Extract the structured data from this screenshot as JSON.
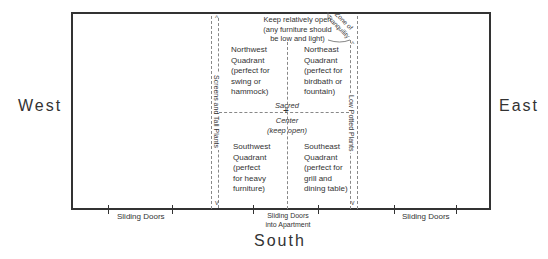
{
  "compass": {
    "west": "West",
    "east": "East",
    "south": "South"
  },
  "top_note": {
    "line1": "Keep relatively open",
    "line2": "(any furniture should",
    "line3": "be low and light)"
  },
  "zone": {
    "line1": "Zone of",
    "line2": "Tranquility"
  },
  "quadrants": {
    "northwest": [
      "Northwest",
      "Quadrant",
      "(perfect for",
      "swing or",
      "hammock)"
    ],
    "northeast": [
      "Northeast",
      "Quadrant",
      "(perfect for",
      "birdbath or",
      "fountain)"
    ],
    "southwest": [
      "Southwest",
      "Quadrant",
      "(perfect",
      "for heavy",
      "furniture)"
    ],
    "southeast": [
      "Southeast",
      "Quadrant",
      "(perfect for",
      "grill and",
      "dining table)"
    ]
  },
  "center": {
    "top": "Sacred",
    "bottom1": "Center",
    "bottom2": "(keep open)"
  },
  "side_bands": {
    "left": "Screens and Tall Plants",
    "right": "Low Potted Plants"
  },
  "doors": {
    "left": "Sliding Doors",
    "center1": "Sliding Doors",
    "center2": "into Apartment",
    "right": "Sliding Doors"
  },
  "colors": {
    "frame": "#333333",
    "dashed": "#888888",
    "text": "#333333"
  }
}
